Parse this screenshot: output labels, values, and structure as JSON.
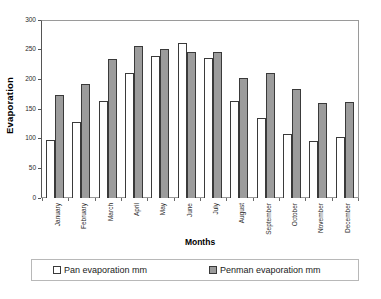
{
  "chart_data": {
    "type": "bar",
    "title": "",
    "xlabel": "Months",
    "ylabel": "Evaporation",
    "ylim": [
      0,
      300
    ],
    "yticks": [
      0,
      50,
      100,
      150,
      200,
      250,
      300
    ],
    "ytick_labels": [
      "0",
      "50",
      "100",
      "150",
      "200",
      "250",
      "300"
    ],
    "grid": false,
    "legend_position": "bottom",
    "categories": [
      "January",
      "February",
      "March",
      "April",
      "May",
      "June",
      "July",
      "August",
      "September",
      "October",
      "November",
      "December"
    ],
    "series": [
      {
        "name": "Pan evaporation mm",
        "color": "#ffffff",
        "values": [
          98,
          128,
          165,
          212,
          241,
          262,
          237,
          164,
          135,
          109,
          97,
          103
        ]
      },
      {
        "name": "Penman evaporation mm",
        "color": "#9c9c9c",
        "values": [
          174,
          193,
          236,
          257,
          253,
          248,
          247,
          204,
          212,
          184,
          161,
          163
        ]
      }
    ],
    "legend": [
      {
        "label": "Pan evaporation mm",
        "swatch": "#ffffff"
      },
      {
        "label": "Penman evaporation mm",
        "swatch": "#9c9c9c"
      }
    ]
  }
}
